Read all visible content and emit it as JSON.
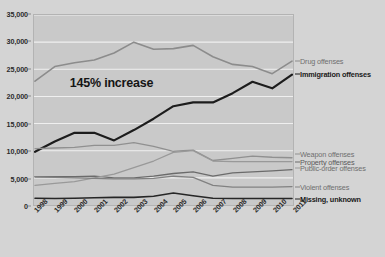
{
  "chart_data": {
    "type": "line",
    "title": "",
    "xlabel": "",
    "ylabel": "",
    "categories": [
      "1998",
      "1999",
      "2000",
      "2001",
      "2002",
      "2003",
      "2004",
      "2005",
      "2006",
      "2007",
      "2008",
      "2009",
      "2010",
      "2011"
    ],
    "ylim": [
      0,
      35000
    ],
    "yticks": [
      0,
      5000,
      10000,
      15000,
      20000,
      25000,
      30000,
      35000
    ],
    "ytick_labels": [
      "0",
      "5,000",
      "10,000",
      "15,000",
      "20,000",
      "25,000",
      "30,000",
      "35,000"
    ],
    "grid": "horizontal",
    "legend_position": "right-inline",
    "annotations": [
      {
        "text": "145% increase",
        "x": "2002",
        "y": 22500
      }
    ],
    "series": [
      {
        "name": "Drug offenses",
        "color": "#8c8c8c",
        "width": 1.6,
        "label_style": "muted",
        "values": [
          22800,
          25500,
          26200,
          26700,
          28000,
          30000,
          28700,
          28800,
          29400,
          27300,
          25900,
          25500,
          24200,
          26500
        ]
      },
      {
        "name": "Immigration offenses",
        "color": "#1c1c1c",
        "width": 2.2,
        "label_style": "bold",
        "values": [
          9800,
          11700,
          13300,
          13300,
          11900,
          13800,
          15900,
          18200,
          18900,
          18900,
          20600,
          22700,
          21500,
          24000
        ]
      },
      {
        "name": "Weapon offenses",
        "color": "#909090",
        "width": 1.3,
        "label_style": "muted",
        "values": [
          10400,
          10500,
          10600,
          11000,
          11000,
          11500,
          10800,
          9900,
          10100,
          8200,
          8600,
          9000,
          8800,
          8700
        ]
      },
      {
        "name": "Property offenses",
        "color": "#6b6b6b",
        "width": 1.3,
        "label_style": "mid",
        "values": [
          5200,
          5200,
          5200,
          5300,
          5000,
          5000,
          5300,
          5800,
          6100,
          5300,
          5900,
          6100,
          6300,
          6500
        ]
      },
      {
        "name": "Public-order offenses",
        "color": "#999999",
        "width": 1.3,
        "label_style": "muted",
        "values": [
          3600,
          4000,
          4300,
          5000,
          5700,
          6900,
          8100,
          9700,
          10000,
          8100,
          8000,
          8000,
          8000,
          8000
        ]
      },
      {
        "name": "Violent offenses",
        "color": "#818181",
        "width": 1.3,
        "label_style": "muted",
        "values": [
          5200,
          5100,
          5000,
          4900,
          4800,
          4800,
          4900,
          5300,
          5100,
          3600,
          3300,
          3300,
          3300,
          3400
        ]
      },
      {
        "name": "Missing, unknown",
        "color": "#262626",
        "width": 1.6,
        "label_style": "bold",
        "values": [
          1250,
          1200,
          1250,
          1350,
          1400,
          1400,
          1600,
          2200,
          1700,
          1250,
          1200,
          1200,
          1200,
          1200
        ]
      }
    ],
    "label_anchor_values": {
      "Drug offenses": 26500,
      "Immigration offenses": 24000,
      "Weapon offenses": 9400,
      "Property offenses": 8100,
      "Public-order offenses": 6900,
      "Violent offenses": 3400,
      "Missing, unknown": 1200
    }
  }
}
